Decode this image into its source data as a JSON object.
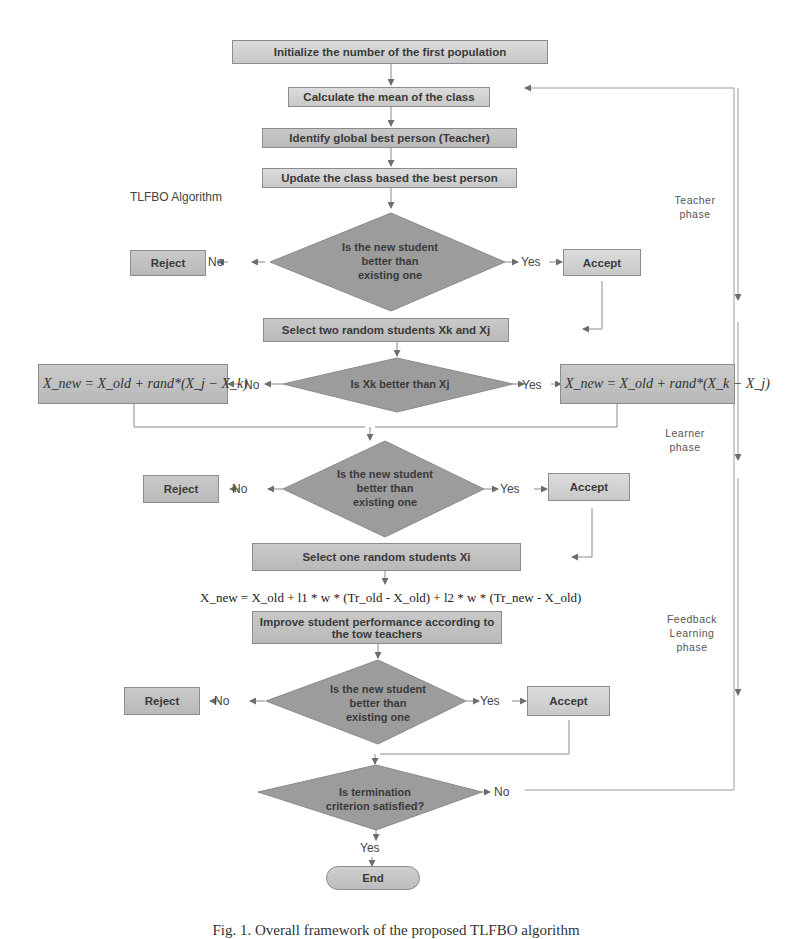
{
  "diagram": {
    "title": "TLFBO Algorithm",
    "caption": "Fig. 1. Overall framework of the proposed TLFBO algorithm",
    "steps": {
      "init": "Initialize the number of the first population",
      "mean": "Calculate the mean of the class",
      "teacher": "Identify global best person (Teacher)",
      "update": "Update the class based the best person",
      "select_two": "Select two random students Xk and Xj",
      "select_one": "Select one random students Xi",
      "improve": "Improve student performance according to the tow teachers",
      "end": "End"
    },
    "decisions": {
      "better1": [
        "Is the new student",
        "better than",
        "existing one"
      ],
      "xk_better": "Is Xk better than Xj",
      "better2": [
        "Is the new student",
        "better than",
        "existing one"
      ],
      "better3": [
        "Is the new student",
        "better than",
        "existing one"
      ],
      "termination": [
        "Is termination",
        "criterion satisfied?"
      ]
    },
    "outcomes": {
      "reject": "Reject",
      "accept": "Accept",
      "yes": "Yes",
      "no": "No"
    },
    "formulas": {
      "left": "X_new = X_old + rand*(X_j − X_k)",
      "right": "X_new = X_old + rand*(X_k − X_j)",
      "feedback": "X_new = X_old + l1 * w * (Tr_old - X_old) + l2 * w * (Tr_new - X_old)"
    },
    "phases": {
      "teacher": [
        "Teacher",
        "phase"
      ],
      "learner": [
        "Learner",
        "phase"
      ],
      "feedback": [
        "Feedback",
        "Learning",
        "phase"
      ]
    },
    "colors": {
      "box": "#c2c2c2",
      "diamond": "#9a9a9a",
      "line": "#8a8a8a",
      "text": "#3a3a3a"
    }
  }
}
